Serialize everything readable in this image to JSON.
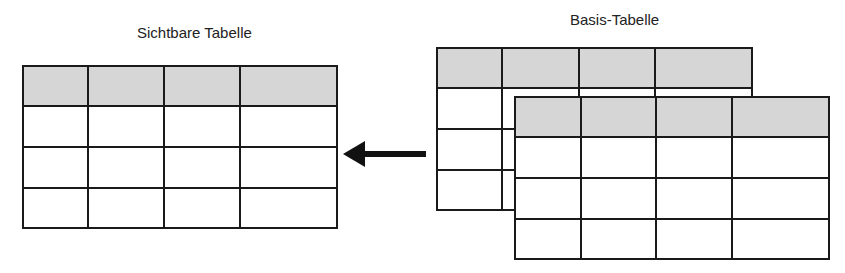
{
  "visible_table": {
    "title": "Sichtbare Tabelle",
    "columns": 4,
    "rows": 4,
    "header_color": "#d6d6d6"
  },
  "base_table": {
    "title": "Basis-Tabelle",
    "layers": 2,
    "columns": 4,
    "rows": 4,
    "header_color": "#d6d6d6"
  },
  "arrow": {
    "direction": "left",
    "from": "base_table",
    "to": "visible_table"
  }
}
